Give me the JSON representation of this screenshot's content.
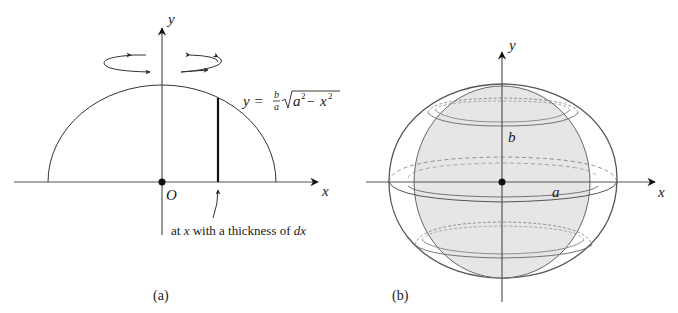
{
  "panel_a": {
    "caption": "(a)",
    "axis_x_label": "x",
    "axis_y_label": "y",
    "origin_label": "O",
    "equation": {
      "lhs": "y =",
      "frac_num": "b",
      "frac_den": "a",
      "radicand_a": "a",
      "exp1": "2",
      "minus": "−",
      "radicand_x": "x",
      "exp2": "2"
    },
    "annotation": {
      "prefix": "at ",
      "var": "x",
      "middle": " with a thickness of ",
      "diff": "dx"
    },
    "rotation_icon": "rotation-arrows-icon"
  },
  "panel_b": {
    "caption": "(b)",
    "axis_x_label": "x",
    "axis_y_label": "y",
    "semi_axis_a_label": "a",
    "semi_axis_b_label": "b",
    "fill_color": "#e6e6e6",
    "line_color": "#555555"
  }
}
